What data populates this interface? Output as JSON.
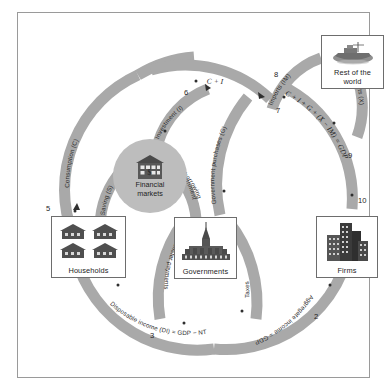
{
  "figure": {
    "background": "#ffffff",
    "frame_color": "#9a9a9a",
    "band_color": "#a9a9a9",
    "node_fill": "#bdbdbd"
  },
  "agents": {
    "households": {
      "label": "Households",
      "icon": "houses-icon"
    },
    "governments": {
      "label": "Governments",
      "icon": "parliament-building-icon"
    },
    "firms": {
      "label": "Firms",
      "icon": "office-buildings-icon"
    },
    "rest_of_world": {
      "label": "Rest of the\nworld",
      "line1": "Rest of the",
      "line2": "world",
      "icon": "cargo-ship-icon"
    },
    "financial_markets": {
      "line1": "Financial",
      "line2": "markets",
      "icon": "bank-building-icon"
    }
  },
  "flows": [
    {
      "id": "consumption",
      "label": "Consumption (C)"
    },
    {
      "id": "saving",
      "label": "Saving (S)"
    },
    {
      "id": "investment",
      "label": "Investment (I)"
    },
    {
      "id": "government-borrowing",
      "label": "Government\nborrowing",
      "line1": "Government",
      "line2": "borrowing"
    },
    {
      "id": "c-plus-i",
      "label": "C + I",
      "italic": true
    },
    {
      "id": "government-purchases",
      "label": "Government purchases (G)"
    },
    {
      "id": "imports",
      "label": "Imports (IM)"
    },
    {
      "id": "exports",
      "label": "Exports (X)"
    },
    {
      "id": "gdp-expenditure",
      "label": "C + I + G + (X − IM) = GDP",
      "italic": true
    },
    {
      "id": "aggregate-income",
      "label": "Aggregate income = GDP"
    },
    {
      "id": "taxes",
      "label": "Taxes"
    },
    {
      "id": "transfer-payments",
      "label": "Transfer payments"
    },
    {
      "id": "disposable-income",
      "label": "Disposable income (DI) = GDP − NT"
    }
  ],
  "node_numbers": [
    {
      "id": "n1",
      "value": "1"
    },
    {
      "id": "n2",
      "value": "2"
    },
    {
      "id": "n3",
      "value": "3"
    },
    {
      "id": "n4",
      "value": "4"
    },
    {
      "id": "n5",
      "value": "5"
    },
    {
      "id": "n6",
      "value": "6"
    },
    {
      "id": "n7",
      "value": "7"
    },
    {
      "id": "n8",
      "value": "8"
    },
    {
      "id": "n9",
      "value": "9"
    },
    {
      "id": "n10",
      "value": "10"
    }
  ]
}
